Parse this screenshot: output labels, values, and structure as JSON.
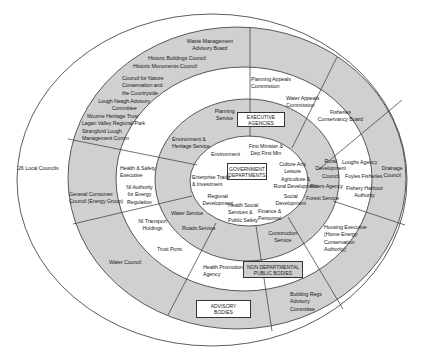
{
  "diagram": {
    "colors": {
      "shaded": "#d0d0d0",
      "line": "#333333",
      "background": "#ffffff"
    },
    "rings": [
      {
        "name": "Government Departments",
        "label": "GOVERNMENT\nDEPARTMENTS"
      },
      {
        "name": "Executive Agencies",
        "label": "EXECUTIVE\nAGENCIES"
      },
      {
        "name": "Non Departmental Public Bodies",
        "label": "NON DEPARTMENTAL\nPUBLIC BODIES"
      },
      {
        "name": "Advisory Bodies",
        "label": "ADVISORY\nBODIES"
      },
      {
        "name": "Local Councils",
        "label": "26 Local Councils"
      }
    ],
    "departments": [
      "Environment",
      "First Minister &\nDep First Min",
      "Culture Arts\nLeisure",
      "Agriculture &\nRural Development",
      "Social\nDevelopment",
      "Finance &\nPersonnel",
      "Health Social\nServices &\nPublic Safety",
      "Regional\nDevelopment",
      "Enterprise Trade\n& Investment"
    ],
    "executive_agencies": [
      "Planning\nService",
      "Environment &\nHeritage Service",
      "Rural\nDevelopment\nCouncil",
      "Rivers Agency",
      "Forest Service",
      "Construction\nService",
      "Water Service",
      "Roads Service"
    ],
    "ndpbs": [
      "Planning Appeals\nCommission",
      "Water Appeals\nCommission",
      "Fisheries\nConservancy Board",
      "Loughs Agency",
      "Foyles Fisheries",
      "Fishery Harbour\nAuthority",
      "Housing Executive\n(Home Energy\nConservation\nAuthority)",
      "Health Promotion\nAgency",
      "Trust Ports",
      "NI Transport\nHoldings",
      "Health & Safety\nExecutive",
      "NI Authority\nfor Energy\nRegulation"
    ],
    "advisory_bodies": [
      "Waste Management\nAdvisory Board",
      "Historic Buildings Council",
      "Historic Monuments Council",
      "Council for Nature\nConservation and\nthe Countryside",
      "Lough Neagh Advisory\nCommittee",
      "Mourne Heritage Trust",
      "Lagan Valley Regional Park",
      "Strangford Lough\nManagement Comm",
      "General Consumer\nCouncil (Energy Group)",
      "Water Council",
      "Building Regs\nAdvisory\nCommittee",
      "Drainage\nCouncil"
    ]
  }
}
